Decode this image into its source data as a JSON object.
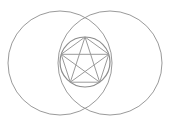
{
  "diagram": {
    "stroke_color": "#9a9a9a",
    "inner_stroke_color": "#8c8c8c",
    "background": "#ffffff",
    "outer_circles": [
      {
        "cx": 60,
        "cy": 63,
        "r": 52
      },
      {
        "cx": 110,
        "cy": 63,
        "r": 52
      }
    ],
    "inner_circle": {
      "cx": 85,
      "cy": 62,
      "r": 25
    },
    "pentagram_points": [
      [
        85,
        37
      ],
      [
        108.8,
        54.3
      ],
      [
        99.7,
        82.2
      ],
      [
        70.3,
        82.2
      ],
      [
        61.2,
        54.3
      ]
    ]
  }
}
